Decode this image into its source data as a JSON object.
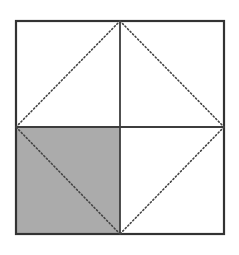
{
  "figure": {
    "canvas": {
      "width": 239,
      "height": 255,
      "background": "#ffffff"
    },
    "colors": {
      "stroke": "#3a3a3a",
      "border_stroke": "#333333",
      "midline_stroke": "#3d3d3d",
      "dotted_stroke": "#444444",
      "shade_fill": "#ababab",
      "background": "#ffffff"
    },
    "strokes": {
      "border_width": 2.2,
      "midline_width": 1.8,
      "dotted_width": 1.6,
      "dash_pattern": "1.2 2.4"
    },
    "square": {
      "label": "outer-square",
      "left": 16,
      "top": 21,
      "right": 224,
      "bottom": 234,
      "width": 208,
      "height": 213
    },
    "points": {
      "top_left": [
        16,
        21
      ],
      "top_mid": [
        120,
        21
      ],
      "top_right": [
        224,
        21
      ],
      "left_mid": [
        16,
        127
      ],
      "center": [
        120,
        127
      ],
      "right_mid": [
        224,
        127
      ],
      "bottom_left": [
        16,
        234
      ],
      "bottom_mid": [
        120,
        234
      ],
      "bottom_right": [
        224,
        234
      ]
    },
    "midlines": [
      {
        "name": "vertical-midline",
        "x1": 120,
        "y1": 21,
        "x2": 120,
        "y2": 234
      },
      {
        "name": "horizontal-midline",
        "x1": 16,
        "y1": 127,
        "x2": 224,
        "y2": 127
      }
    ],
    "diamond": {
      "label": "inscribed-diamond",
      "style": "dotted",
      "vertices": [
        [
          120,
          21
        ],
        [
          224,
          127
        ],
        [
          120,
          234
        ],
        [
          16,
          127
        ]
      ],
      "edges": [
        {
          "name": "diamond-edge-top-right",
          "x1": 120,
          "y1": 21,
          "x2": 224,
          "y2": 127
        },
        {
          "name": "diamond-edge-bottom-right",
          "x1": 224,
          "y1": 127,
          "x2": 120,
          "y2": 234
        },
        {
          "name": "diamond-edge-bottom-left",
          "x1": 120,
          "y1": 234,
          "x2": 16,
          "y2": 127
        },
        {
          "name": "diamond-edge-top-left",
          "x1": 16,
          "y1": 127,
          "x2": 120,
          "y2": 21
        }
      ]
    },
    "shaded_region": {
      "label": "bottom-left-quadrant",
      "fill": "#ababab",
      "polygon": "16,127 120,127 120,234 16,234"
    }
  }
}
